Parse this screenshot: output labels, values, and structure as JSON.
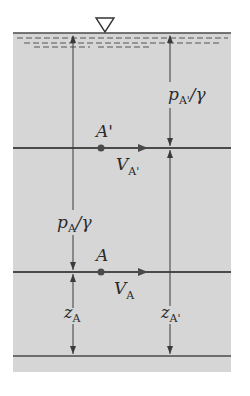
{
  "colors": {
    "fluid": "#d6d6d6",
    "line": "#4a4a4a",
    "text": "#2a2a2a",
    "background": "#ffffff"
  },
  "surface_symbol": "free-surface-triangle",
  "labels": {
    "pressure_head_Aprime": {
      "main": "p",
      "sub": "A'",
      "tail": "/γ"
    },
    "pressure_head_A": {
      "main": "p",
      "sub": "A",
      "tail": "/γ"
    },
    "point_Aprime": "A'",
    "point_A": "A",
    "velocity_Aprime": {
      "main": "V",
      "sub": "A'"
    },
    "velocity_A": {
      "main": "V",
      "sub": "A"
    },
    "elevation_A": {
      "main": "z",
      "sub": "A"
    },
    "elevation_Aprime": {
      "main": "z",
      "sub": "A'"
    }
  }
}
